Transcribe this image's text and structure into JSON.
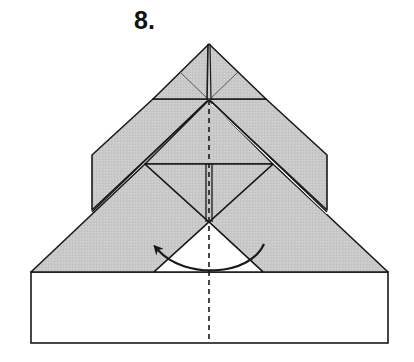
{
  "step": {
    "label": "8."
  },
  "diagram": {
    "colors": {
      "paper_colored_side": "#c8c8c8",
      "paper_white_side": "#ffffff",
      "line": "#1a1a1a"
    },
    "elements": [
      {
        "name": "bottom-white-rectangle",
        "description": "white base band of paper"
      },
      {
        "name": "lower-gray-wings",
        "description": "large gray triangle flaps with center notch"
      },
      {
        "name": "upper-gray-flaps",
        "description": "inner gray flaps with vertical cut edges"
      },
      {
        "name": "top-point",
        "description": "top apex triangle with crease lines"
      },
      {
        "name": "center-fold-line",
        "description": "vertical dashed valley fold line"
      },
      {
        "name": "fold-arrow",
        "description": "curved arrow from right to left indicating fold in half"
      }
    ]
  }
}
